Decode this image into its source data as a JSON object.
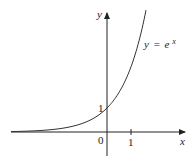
{
  "chart_data": {
    "type": "line",
    "title": "",
    "function_label": "y = e^x",
    "function_label_parts": {
      "lhs": "y",
      "eq": "=",
      "base": "e",
      "exp": "x"
    },
    "xlabel": "x",
    "ylabel": "y",
    "x_ticks": [
      {
        "value": 0,
        "label": "0"
      },
      {
        "value": 1,
        "label": "1"
      }
    ],
    "y_ticks": [
      {
        "value": 1,
        "label": "1"
      }
    ],
    "xlim": [
      -4,
      3.2
    ],
    "ylim": [
      -1,
      5
    ],
    "grid": false,
    "series": [
      {
        "name": "y = e^x",
        "x": [
          -4,
          -3,
          -2,
          -1,
          0,
          0.5,
          1,
          1.5,
          1.58
        ],
        "y": [
          0.018,
          0.05,
          0.135,
          0.368,
          1,
          1.649,
          2.718,
          4.482,
          4.855
        ]
      }
    ],
    "annotations": [
      {
        "x": 0,
        "y": 1,
        "text": "1",
        "type": "point"
      }
    ],
    "colors": {
      "axis": "#222222",
      "curve": "#333333"
    }
  }
}
